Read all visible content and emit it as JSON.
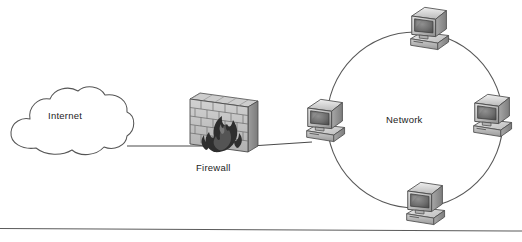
{
  "diagram": {
    "type": "network-topology",
    "background_color": "#ffffff",
    "nodes": {
      "internet": {
        "label": "Internet",
        "icon": "cloud-icon",
        "shape": "cloud",
        "x": 68,
        "y": 124
      },
      "firewall": {
        "label": "Firewall",
        "icon": "brick-wall-flame-icon",
        "shape": "isometric-brick-wall-with-flames",
        "x": 224,
        "y": 122
      },
      "network": {
        "label": "Network",
        "icon": "ring-network-icon",
        "shape": "circle",
        "center_x": 415,
        "center_y": 120,
        "radius": 88
      }
    },
    "computers": [
      {
        "name": "gateway-computer",
        "icon": "crt-computer-icon",
        "position": "left",
        "x": 324,
        "y": 120
      },
      {
        "name": "top-computer",
        "icon": "crt-computer-icon",
        "position": "top",
        "x": 427,
        "y": 30
      },
      {
        "name": "right-computer",
        "icon": "crt-computer-icon",
        "position": "right",
        "x": 490,
        "y": 117
      },
      {
        "name": "bottom-computer",
        "icon": "crt-computer-icon",
        "position": "bottom",
        "x": 424,
        "y": 205
      }
    ],
    "links": [
      {
        "name": "internet-to-firewall-link",
        "from": "internet",
        "to": "firewall"
      },
      {
        "name": "firewall-to-gateway-link",
        "from": "firewall",
        "to": "gateway-computer"
      }
    ],
    "footer_rule": {
      "name": "footer-divider",
      "y": 228
    },
    "colors": {
      "outline": "#4a4a4a",
      "text": "#1d1d1d",
      "bezel_light": "#d7d7d7",
      "bezel_mid": "#b4b4b4",
      "bezel_dark": "#8d8d8d",
      "screen": "#6e6e6e",
      "brick_light": "#c9c9c9",
      "brick_dark": "#9a9a9a",
      "flame": "#2b2b2b",
      "rule": "#5a5a5a"
    }
  }
}
